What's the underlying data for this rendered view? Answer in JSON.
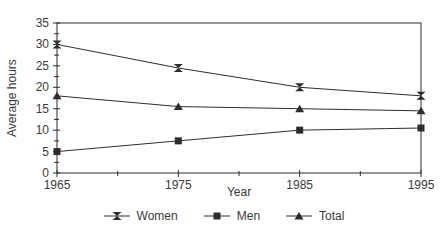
{
  "figure": {
    "background": "#ffffff",
    "line_color": "#2c2c2c",
    "text_color": "#3a3a3a"
  },
  "chart_data": {
    "type": "line",
    "title": "",
    "xlabel": "Year",
    "ylabel": "Average hours",
    "x": [
      1965,
      1975,
      1985,
      1995
    ],
    "x_tick_labels": [
      "1965",
      "1975",
      "1985",
      "1995"
    ],
    "x_minor_ticks": [
      1970,
      1980,
      1990
    ],
    "ylim": [
      0,
      35
    ],
    "yticks": [
      0,
      5,
      10,
      15,
      20,
      25,
      30,
      35
    ],
    "y_minor_ticks": [
      2.5,
      7.5,
      12.5,
      17.5,
      22.5,
      27.5,
      32.5
    ],
    "grid": false,
    "legend_position": "bottom",
    "series": [
      {
        "name": "Women",
        "marker": "hourglass",
        "values": [
          30,
          24.5,
          20,
          18
        ]
      },
      {
        "name": "Men",
        "marker": "square",
        "values": [
          5,
          7.5,
          10,
          10.5
        ]
      },
      {
        "name": "Total",
        "marker": "triangle",
        "values": [
          18,
          15.5,
          15,
          14.5
        ]
      }
    ]
  }
}
